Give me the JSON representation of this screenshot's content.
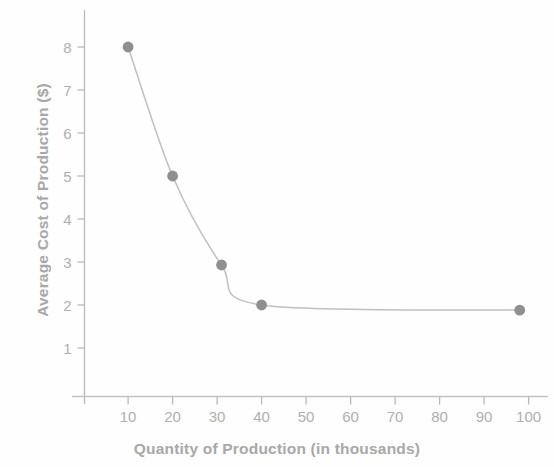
{
  "chart_data": {
    "type": "line",
    "title": "",
    "subtitle": "",
    "xlabel": "Quantity of Production (in thousands)",
    "ylabel": "Average Cost of Production ($)",
    "x": [
      10,
      20,
      31,
      40,
      98
    ],
    "values": [
      8.0,
      5.0,
      2.93,
      2.0,
      1.88
    ],
    "series": [
      {
        "name": "Average Cost of Production",
        "x": [
          10,
          20,
          31,
          40,
          98
        ],
        "values": [
          8.0,
          5.0,
          2.93,
          2.0,
          1.88
        ]
      }
    ],
    "xlim": [
      0,
      106
    ],
    "ylim": [
      0,
      8.85
    ],
    "xticks": [
      10,
      20,
      30,
      40,
      50,
      60,
      70,
      80,
      90,
      100
    ],
    "xtick_labels": [
      "10",
      "20",
      "30",
      "40",
      "50",
      "60",
      "70",
      "80",
      "90",
      "100"
    ],
    "yticks": [
      1,
      2,
      3,
      4,
      5,
      6,
      7,
      8
    ],
    "ytick_labels": [
      "1",
      "2",
      "3",
      "4",
      "5",
      "6",
      "7",
      "8"
    ],
    "grid": false,
    "legend": false,
    "legend_position": "none",
    "marker": "circle",
    "annotations": [],
    "colors": {
      "line": "#c0c0c0",
      "marker": "#8f8f8f",
      "axis": "#b8b8b8",
      "tick_label": "#b0b0b0",
      "axis_title": "#a8a8a8",
      "background": "#fefefe"
    }
  }
}
